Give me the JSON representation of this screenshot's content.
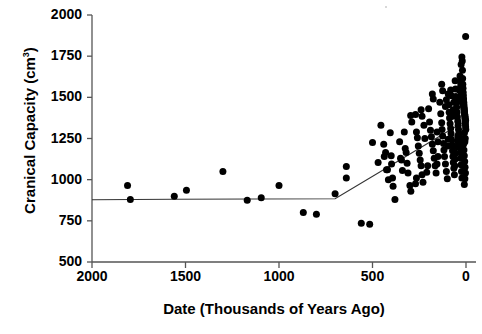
{
  "chart_data": {
    "type": "scatter",
    "title": "",
    "xlabel": "Date (Thousands of Years Ago)",
    "ylabel": "Cranical Capacity (cm3)",
    "ylabel_base": "Cranical Capacity (cm",
    "ylabel_sup": "3",
    "ylabel_tail": ")",
    "xlim": [
      2100,
      -20
    ],
    "ylim": [
      500,
      2000
    ],
    "x_axis_reversed": true,
    "grid": false,
    "legend": null,
    "xticks": [
      2000,
      1500,
      1000,
      500,
      0
    ],
    "xtick_labels": [
      "2000",
      "1500",
      "1000",
      "500",
      "0"
    ],
    "yticks": [
      500,
      750,
      1000,
      1250,
      1500,
      1750,
      2000
    ],
    "ytick_labels": [
      "500",
      "750",
      "1000",
      "1250",
      "1500",
      "1750",
      "2000"
    ],
    "marker": {
      "shape": "circle",
      "color": "#000000",
      "size": 4.4
    },
    "series": [
      {
        "name": "Hominin cranial capacity",
        "points": [
          [
            1810,
            965
          ],
          [
            1795,
            880
          ],
          [
            1560,
            900
          ],
          [
            1495,
            935
          ],
          [
            1300,
            1050
          ],
          [
            1170,
            875
          ],
          [
            1095,
            890
          ],
          [
            1000,
            965
          ],
          [
            870,
            800
          ],
          [
            800,
            790
          ],
          [
            700,
            915
          ],
          [
            640,
            1080
          ],
          [
            640,
            1010
          ],
          [
            560,
            735
          ],
          [
            515,
            730
          ],
          [
            500,
            1225
          ],
          [
            470,
            1105
          ],
          [
            455,
            1330
          ],
          [
            440,
            1215
          ],
          [
            437,
            1140
          ],
          [
            430,
            1165
          ],
          [
            425,
            1060
          ],
          [
            420,
            1060
          ],
          [
            415,
            1000
          ],
          [
            405,
            1285
          ],
          [
            400,
            1145
          ],
          [
            398,
            1095
          ],
          [
            393,
            1010
          ],
          [
            390,
            960
          ],
          [
            380,
            880
          ],
          [
            355,
            1230
          ],
          [
            350,
            1130
          ],
          [
            345,
            1120
          ],
          [
            340,
            1055
          ],
          [
            330,
            1290
          ],
          [
            325,
            1190
          ],
          [
            320,
            1165
          ],
          [
            315,
            1100
          ],
          [
            310,
            1040
          ],
          [
            300,
            965
          ],
          [
            295,
            930
          ],
          [
            270,
            1395
          ],
          [
            265,
            1290
          ],
          [
            260,
            1255
          ],
          [
            255,
            1205
          ],
          [
            250,
            1160
          ],
          [
            245,
            1120
          ],
          [
            240,
            1085
          ],
          [
            235,
            1030
          ],
          [
            230,
            985
          ],
          [
            225,
            1330
          ],
          [
            220,
            1250
          ],
          [
            200,
            1430
          ],
          [
            195,
            1350
          ],
          [
            190,
            1300
          ],
          [
            185,
            1260
          ],
          [
            180,
            1215
          ],
          [
            175,
            1175
          ],
          [
            170,
            1130
          ],
          [
            165,
            1085
          ],
          [
            160,
            1040
          ],
          [
            155,
            1290
          ],
          [
            150,
            1230
          ],
          [
            140,
            1470
          ],
          [
            135,
            1400
          ],
          [
            130,
            1345
          ],
          [
            128,
            1305
          ],
          [
            125,
            1265
          ],
          [
            120,
            1220
          ],
          [
            118,
            1180
          ],
          [
            115,
            1140
          ],
          [
            110,
            1095
          ],
          [
            105,
            1050
          ],
          [
            100,
            1005
          ],
          [
            95,
            1520
          ],
          [
            92,
            1455
          ],
          [
            90,
            1410
          ],
          [
            88,
            1375
          ],
          [
            85,
            1340
          ],
          [
            82,
            1310
          ],
          [
            80,
            1280
          ],
          [
            78,
            1245
          ],
          [
            75,
            1210
          ],
          [
            72,
            1175
          ],
          [
            70,
            1140
          ],
          [
            68,
            1105
          ],
          [
            65,
            1070
          ],
          [
            62,
            1030
          ],
          [
            58,
            1600
          ],
          [
            56,
            1550
          ],
          [
            54,
            1505
          ],
          [
            52,
            1470
          ],
          [
            50,
            1440
          ],
          [
            48,
            1410
          ],
          [
            46,
            1380
          ],
          [
            44,
            1355
          ],
          [
            42,
            1330
          ],
          [
            40,
            1305
          ],
          [
            38,
            1280
          ],
          [
            36,
            1255
          ],
          [
            34,
            1230
          ],
          [
            32,
            1200
          ],
          [
            30,
            1165
          ],
          [
            28,
            1130
          ],
          [
            26,
            1090
          ],
          [
            24,
            1050
          ],
          [
            22,
            1010
          ],
          [
            20,
            1720
          ],
          [
            19,
            1665
          ],
          [
            18,
            1615
          ],
          [
            17,
            1580
          ],
          [
            16,
            1555
          ],
          [
            15,
            1530
          ],
          [
            14,
            1510
          ],
          [
            13,
            1490
          ],
          [
            12,
            1470
          ],
          [
            11,
            1455
          ],
          [
            10,
            1440
          ],
          [
            9,
            1425
          ],
          [
            8,
            1410
          ],
          [
            7,
            1395
          ],
          [
            6,
            1380
          ],
          [
            5,
            1365
          ],
          [
            4,
            1350
          ],
          [
            3,
            1335
          ],
          [
            2,
            1320
          ],
          [
            1,
            1305
          ],
          [
            18,
            1480
          ],
          [
            16,
            1465
          ],
          [
            14,
            1450
          ],
          [
            12,
            1435
          ],
          [
            10,
            1420
          ],
          [
            8,
            1405
          ],
          [
            6,
            1390
          ],
          [
            4,
            1375
          ],
          [
            2,
            1360
          ],
          [
            20,
            1500
          ],
          [
            22,
            1515
          ],
          [
            24,
            1525
          ],
          [
            26,
            1545
          ],
          [
            28,
            1570
          ],
          [
            30,
            1595
          ],
          [
            32,
            1630
          ],
          [
            15,
            1250
          ],
          [
            13,
            1215
          ],
          [
            11,
            1180
          ],
          [
            9,
            1145
          ],
          [
            7,
            1110
          ],
          [
            5,
            1075
          ],
          [
            3,
            1040
          ],
          [
            6,
            1005
          ],
          [
            9,
            970
          ],
          [
            4,
            1250
          ],
          [
            6,
            1230
          ],
          [
            8,
            1285
          ],
          [
            2,
            1870
          ],
          [
            22,
            1745
          ],
          [
            26,
            1700
          ],
          [
            36,
            1545
          ],
          [
            38,
            1500
          ],
          [
            40,
            1475
          ],
          [
            44,
            1265
          ],
          [
            46,
            1235
          ],
          [
            48,
            1200
          ],
          [
            55,
            1160
          ],
          [
            58,
            1125
          ],
          [
            60,
            1085
          ],
          [
            65,
            1470
          ],
          [
            68,
            1425
          ],
          [
            72,
            1385
          ],
          [
            78,
            1510
          ],
          [
            82,
            1545
          ],
          [
            95,
            1245
          ],
          [
            98,
            1205
          ],
          [
            105,
            1485
          ],
          [
            110,
            1445
          ],
          [
            125,
            1540
          ],
          [
            130,
            1580
          ],
          [
            150,
            1140
          ],
          [
            155,
            1095
          ],
          [
            175,
            1490
          ],
          [
            180,
            1520
          ],
          [
            205,
            1085
          ],
          [
            210,
            1045
          ],
          [
            235,
            1385
          ],
          [
            240,
            1425
          ],
          [
            265,
            1010
          ],
          [
            270,
            975
          ],
          [
            290,
            1350
          ],
          [
            296,
            1390
          ]
        ]
      }
    ],
    "fit_line": {
      "name": "piecewise regression",
      "color": "#333333",
      "width": 1.2,
      "vertices": [
        [
          2000,
          878
        ],
        [
          1560,
          881
        ],
        [
          700,
          884
        ],
        [
          0,
          1360
        ]
      ]
    }
  },
  "artifacts": {
    "speck_note": "faint scan speck near top of plot"
  }
}
